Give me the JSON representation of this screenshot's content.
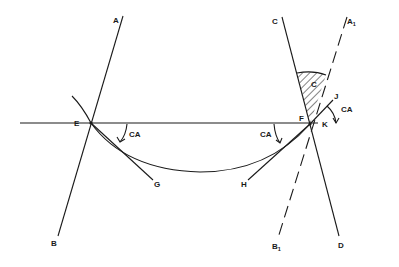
{
  "diagram": {
    "type": "contact-angle geometry",
    "points": {
      "A": "A",
      "B": "B",
      "C": "C",
      "D": "D",
      "E": "E",
      "F": "F",
      "G": "G",
      "H": "H",
      "J": "J",
      "K": "K",
      "A1_base": "A",
      "A1_sub": "1",
      "B1_base": "B",
      "B1_sub": "1"
    },
    "angle_labels": {
      "ca_E": "CA",
      "ca_F_left": "CA",
      "ca_F_right": "CA",
      "hatched_region": "C"
    },
    "colors": {
      "line": "#1a1a1a",
      "background": "#ffffff"
    }
  }
}
